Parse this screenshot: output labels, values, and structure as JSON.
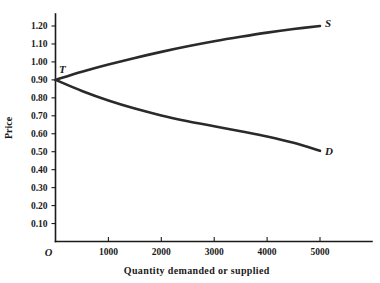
{
  "chart_data": {
    "type": "line",
    "title": "",
    "xlabel": "Quantity demanded or supplied",
    "ylabel": "Price",
    "xlim": [
      0,
      5600
    ],
    "ylim": [
      0,
      1.25
    ],
    "grid": false,
    "legend_position": "inline-end-of-curve",
    "x_ticks": [
      1000,
      2000,
      3000,
      4000,
      5000
    ],
    "x_tick_labels": [
      "1000",
      "2000",
      "3000",
      "4000",
      "5000"
    ],
    "y_ticks": [
      0.1,
      0.2,
      0.3,
      0.4,
      0.5,
      0.6,
      0.7,
      0.8,
      0.9,
      1.0,
      1.1,
      1.2
    ],
    "y_tick_labels": [
      "0.10",
      "0.20",
      "0.30",
      "0.40",
      "0.50",
      "0.60",
      "0.70",
      "0.80",
      "0.90",
      "1.00",
      "1.10",
      "1.20"
    ],
    "origin_label": "O",
    "intersection_label": "T",
    "intersection_point": {
      "x": 0,
      "y": 0.9
    },
    "series": [
      {
        "name": "S",
        "label": "S",
        "description": "supply curve",
        "x": [
          0,
          500,
          1000,
          1500,
          2000,
          2500,
          3000,
          3500,
          4000,
          4500,
          5000
        ],
        "values": [
          0.9,
          0.945,
          0.985,
          1.022,
          1.056,
          1.087,
          1.115,
          1.14,
          1.163,
          1.183,
          1.2
        ]
      },
      {
        "name": "D",
        "label": "D",
        "description": "demand curve",
        "x": [
          0,
          500,
          1000,
          1500,
          2000,
          2500,
          3000,
          3500,
          4000,
          4500,
          5000
        ],
        "values": [
          0.9,
          0.838,
          0.785,
          0.74,
          0.702,
          0.67,
          0.642,
          0.614,
          0.585,
          0.55,
          0.505
        ]
      }
    ]
  },
  "colors": {
    "background": "#ffffff",
    "axis": "#1a1a1a",
    "curve": "#2a2a2a",
    "text": "#1a1a1a"
  }
}
